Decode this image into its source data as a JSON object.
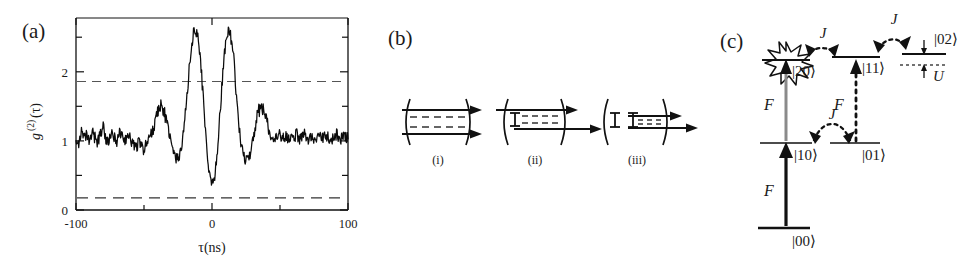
{
  "figure": {
    "panels": [
      {
        "id": "a",
        "label": "(a)"
      },
      {
        "id": "b",
        "label": "(b)"
      },
      {
        "id": "c",
        "label": "(c)"
      }
    ]
  },
  "panel_a": {
    "label": "(a)",
    "ylabel": "g",
    "ylabel_sup": "(2)",
    "ylabel_arg": "(τ)",
    "xlabel": "τ(ns)",
    "xticks": [
      "-100",
      "0",
      "100"
    ],
    "yticks": [
      "0",
      "1",
      "2"
    ],
    "guide_upper_label": "1.72",
    "guide_lower_label": "0.35"
  },
  "chart_data": {
    "type": "line",
    "title": "",
    "xlabel": "τ(ns)",
    "ylabel": "g(2)(τ)",
    "xlim": [
      -100,
      100
    ],
    "ylim": [
      0,
      2.7
    ],
    "xticks": [
      -100,
      0,
      100
    ],
    "xminorticks": [
      -50,
      50
    ],
    "yticks": [
      0,
      1,
      2
    ],
    "yminorticks": [
      0.5,
      1.5,
      2.5
    ],
    "grid": false,
    "legend": "none",
    "annotations": [
      {
        "type": "hline",
        "y": 1.72,
        "style": "dashed",
        "note": "upper reference level"
      },
      {
        "type": "hline",
        "y": 0.35,
        "style": "dashed",
        "note": "lower reference level / antibunching floor"
      }
    ],
    "series": [
      {
        "name": "g2",
        "x": [
          -100,
          -98,
          -96,
          -94,
          -92,
          -90,
          -88,
          -86,
          -84,
          -82,
          -80,
          -78,
          -76,
          -74,
          -72,
          -70,
          -68,
          -66,
          -64,
          -62,
          -60,
          -58,
          -56,
          -54,
          -52,
          -50,
          -48,
          -46,
          -44,
          -42,
          -40,
          -38,
          -36,
          -34,
          -32,
          -30,
          -28,
          -26,
          -24,
          -22,
          -20,
          -18,
          -16,
          -14,
          -12,
          -10,
          -8,
          -6,
          -4,
          -2,
          0,
          2,
          4,
          6,
          8,
          10,
          12,
          14,
          16,
          18,
          20,
          22,
          24,
          26,
          28,
          30,
          32,
          34,
          36,
          38,
          40,
          42,
          44,
          46,
          48,
          50,
          52,
          54,
          56,
          58,
          60,
          62,
          64,
          66,
          68,
          70,
          72,
          74,
          76,
          78,
          80,
          82,
          84,
          86,
          88,
          90,
          92,
          94,
          96,
          98,
          100
        ],
        "y": [
          1.02,
          0.95,
          1.08,
          0.99,
          1.05,
          0.93,
          1.1,
          1.01,
          0.96,
          1.07,
          1.19,
          1.0,
          0.94,
          1.06,
          1.02,
          0.97,
          1.09,
          1.03,
          0.98,
          1.05,
          1.0,
          0.93,
          0.88,
          0.95,
          0.9,
          0.85,
          0.93,
          1.02,
          1.1,
          1.22,
          1.38,
          1.48,
          1.42,
          1.3,
          1.12,
          0.92,
          0.78,
          0.72,
          0.76,
          0.92,
          1.25,
          1.7,
          2.15,
          2.45,
          2.56,
          2.4,
          2.0,
          1.45,
          0.9,
          0.52,
          0.35,
          0.48,
          0.85,
          1.4,
          1.95,
          2.35,
          2.52,
          2.42,
          2.1,
          1.62,
          1.15,
          0.85,
          0.72,
          0.7,
          0.8,
          0.98,
          1.2,
          1.38,
          1.45,
          1.4,
          1.28,
          1.12,
          1.0,
          0.95,
          1.02,
          1.06,
          0.99,
          1.05,
          0.96,
          1.04,
          1.0,
          1.08,
          0.97,
          1.03,
          1.06,
          0.98,
          1.02,
          1.07,
          0.95,
          1.01,
          1.04,
          0.99,
          1.06,
          1.0,
          0.96,
          1.03,
          1.08,
          0.98,
          1.02,
          1.05,
          1.0
        ]
      }
    ]
  },
  "panel_b": {
    "label": "(b)",
    "diagrams": [
      {
        "id": "i",
        "label": "(i)",
        "emitters": 0,
        "beams": 2,
        "note": "empty cavity with two modes"
      },
      {
        "id": "ii",
        "label": "(ii)",
        "emitters": 1,
        "beams": 2,
        "note": "cavity with one emitter"
      },
      {
        "id": "iii",
        "label": "(iii)",
        "emitters": 2,
        "beams": 2,
        "note": "cavity with two emitters"
      }
    ]
  },
  "panel_c": {
    "label": "(c)",
    "levels": [
      {
        "name": "|00⟩",
        "id": "state-00"
      },
      {
        "name": "|10⟩",
        "id": "state-10"
      },
      {
        "name": "|01⟩",
        "id": "state-01"
      },
      {
        "name": "|20⟩",
        "id": "state-20"
      },
      {
        "name": "|11⟩",
        "id": "state-11"
      },
      {
        "name": "|02⟩",
        "id": "state-02"
      }
    ],
    "couplings": [
      {
        "symbol": "F",
        "id": "drive-00-10",
        "style": "solid",
        "note": "drive from |00> to |10>"
      },
      {
        "symbol": "F",
        "id": "drive-10-20",
        "style": "solid-gray",
        "note": "drive from |10> to |20>"
      },
      {
        "symbol": "F",
        "id": "drive-01-11",
        "style": "dotted",
        "note": "drive from |01> to |11>"
      },
      {
        "symbol": "J",
        "id": "hop-10-01",
        "style": "dotted-arc",
        "note": "hopping between |10> and |01>"
      },
      {
        "symbol": "J",
        "id": "hop-20-11",
        "style": "dotted-arc",
        "note": "hopping between |20> and |11>"
      },
      {
        "symbol": "J",
        "id": "hop-11-02",
        "style": "dotted-arc",
        "note": "hopping between |11> and |02>"
      }
    ],
    "anharmonicity": {
      "symbol": "U",
      "note": "interaction shift of |02> below the dotted harmonic level"
    },
    "blockade": {
      "id": "blockade-star",
      "note": "starburst marking blockaded |20> state"
    }
  }
}
